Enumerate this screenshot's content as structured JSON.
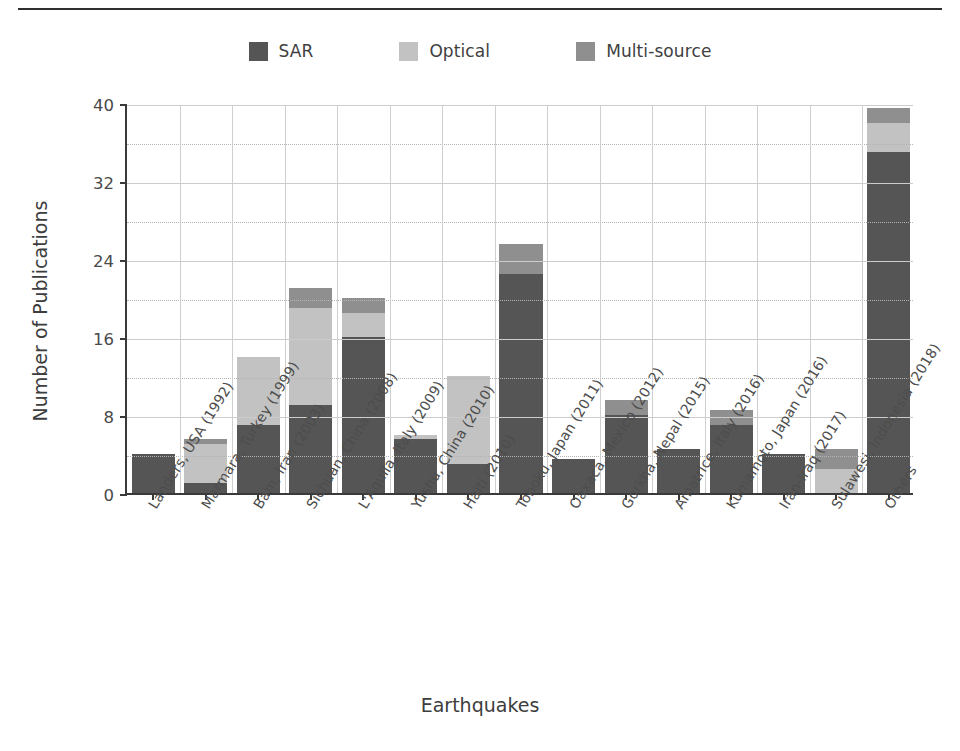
{
  "chart_data": {
    "type": "bar",
    "stacked": true,
    "title": "",
    "xlabel": "Earthquakes",
    "ylabel": "Number of Publications",
    "ylim": [
      0,
      40
    ],
    "yticks": [
      0,
      8,
      16,
      24,
      32,
      40
    ],
    "yticks_minor": [
      4,
      12,
      20,
      28,
      36
    ],
    "grid": true,
    "legend_position": "top-center",
    "categories": [
      "Landers, USA (1992)",
      "Marmara, Turkey (1999)",
      "Bam, Iran (2003)",
      "Sichuan, China (2008)",
      "L'Aquila, Italy (2009)",
      "Yushu, China (2010)",
      "Haiti (2010)",
      "Tohoku, Japan (2011)",
      "Oaxaca, Mexico (2012)",
      "Gorkha, Nepal (2015)",
      "Amatrice, Italy (2016)",
      "Kumamoto, Japan (2016)",
      "Iran-Iraq (2017)",
      "Sulawesi, Indonesia (2018)",
      "Others"
    ],
    "series": [
      {
        "name": "SAR",
        "color": "#555555",
        "values": [
          4,
          1,
          7,
          9,
          16,
          5.5,
          3,
          22.5,
          3.5,
          8,
          4.5,
          7,
          4,
          0,
          35
        ]
      },
      {
        "name": "Optical",
        "color": "#c2c2c2",
        "values": [
          0,
          4,
          7,
          10,
          2.5,
          0.5,
          9,
          0,
          0,
          0,
          0,
          0,
          0,
          2.5,
          3
        ]
      },
      {
        "name": "Multi-source",
        "color": "#8f8f8f",
        "values": [
          0,
          0.5,
          0,
          2,
          1.5,
          0,
          0,
          3,
          0,
          1.5,
          0,
          1.5,
          0,
          2,
          1.5
        ]
      }
    ],
    "totals": [
      4,
      5.5,
      14,
      21,
      20,
      6,
      12,
      25.5,
      3.5,
      9.5,
      4.5,
      8.5,
      4,
      4.5,
      39.5
    ]
  },
  "legend": {
    "items": [
      {
        "label": "SAR",
        "color": "#555555"
      },
      {
        "label": "Optical",
        "color": "#c2c2c2"
      },
      {
        "label": "Multi-source",
        "color": "#8f8f8f"
      }
    ]
  },
  "axes": {
    "x_title": "Earthquakes",
    "y_title": "Number of Publications"
  }
}
